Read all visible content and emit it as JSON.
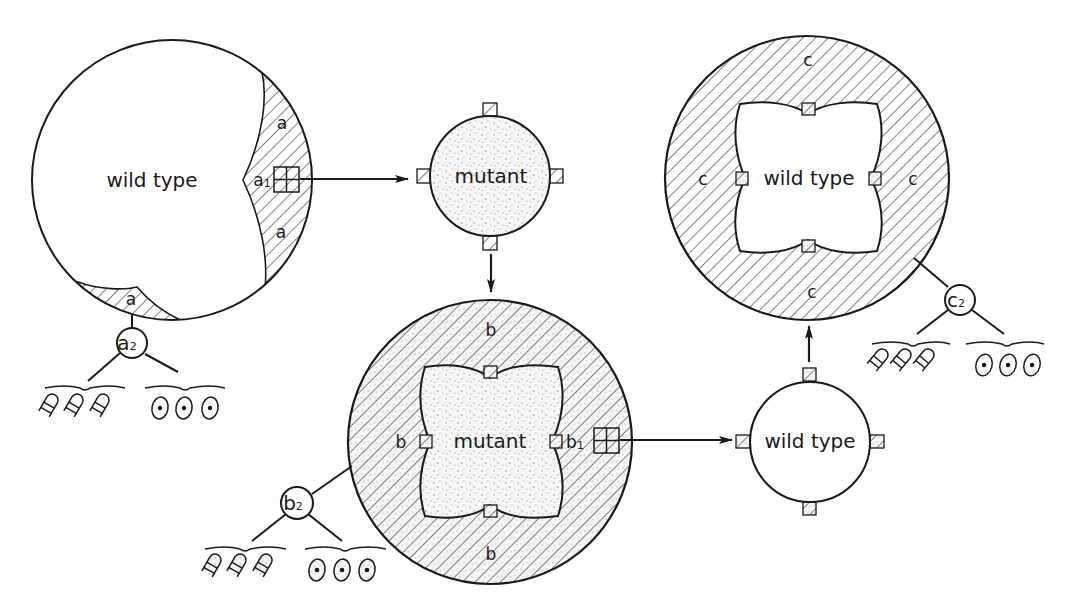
{
  "diagram": {
    "colors": {
      "ink": "#1a1a1a",
      "background": "#ffffff",
      "stipple": "#8a8a8a"
    },
    "panel_a": {
      "main_label": "wild type",
      "region_labels": [
        "a",
        "a",
        "a"
      ],
      "transplant_label": "a",
      "transplant_subscript": "1",
      "tissue_label": "a",
      "tissue_subscript": "2"
    },
    "panel_mutant_small": {
      "main_label": "mutant"
    },
    "panel_b": {
      "main_label": "mutant",
      "region_labels": [
        "b",
        "b",
        "b"
      ],
      "transplant_label": "b",
      "transplant_subscript": "1",
      "tissue_label": "b",
      "tissue_subscript": "2"
    },
    "panel_wild_small": {
      "main_label": "wild type"
    },
    "panel_c": {
      "main_label": "wild type",
      "region_labels": [
        "c",
        "c",
        "c",
        "c"
      ],
      "tissue_label": "c",
      "tissue_subscript": "2"
    }
  }
}
